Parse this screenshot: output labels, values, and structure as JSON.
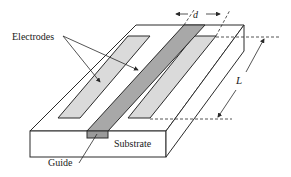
{
  "diagram": {
    "labels": {
      "electrodes": "Electrodes",
      "substrate": "Substrate",
      "guide": "Guide",
      "d": "d",
      "L": "L"
    },
    "colors": {
      "background": "#ffffff",
      "line": "#2a2a2a",
      "guide_fill": "#a8a8a8",
      "guide_front": "#9a9a9a",
      "electrode_fill": "#dadada",
      "substrate_fill": "#ffffff"
    }
  }
}
